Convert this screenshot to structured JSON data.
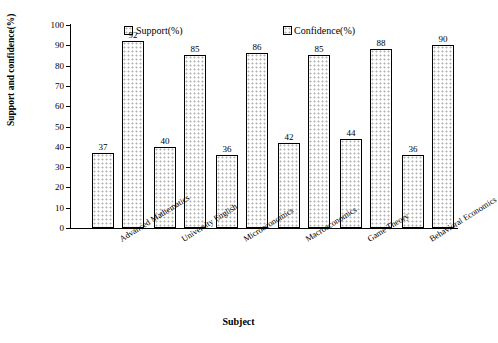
{
  "chart_data": {
    "type": "bar",
    "title": "",
    "xlabel": "Subject",
    "ylabel": "Support and confidence(%)",
    "ylim": [
      0,
      100
    ],
    "ytick_labels": [
      "0",
      "10",
      "20",
      "30",
      "40",
      "50",
      "60",
      "70",
      "80",
      "90",
      "100"
    ],
    "ytick_values": [
      0,
      10,
      20,
      30,
      40,
      50,
      60,
      70,
      80,
      90,
      100
    ],
    "grid": false,
    "legend_position": "top",
    "categories": [
      "Advanced Mathematics",
      "University English",
      "Microeconomics",
      "Macroeconomics",
      "Game Theory",
      "Behavioral Economics"
    ],
    "series": [
      {
        "name": "Support(%)",
        "values": [
          37,
          40,
          36,
          42,
          44,
          36
        ]
      },
      {
        "name": "Confidence(%)",
        "values": [
          92,
          85,
          86,
          85,
          88,
          90
        ]
      }
    ]
  }
}
